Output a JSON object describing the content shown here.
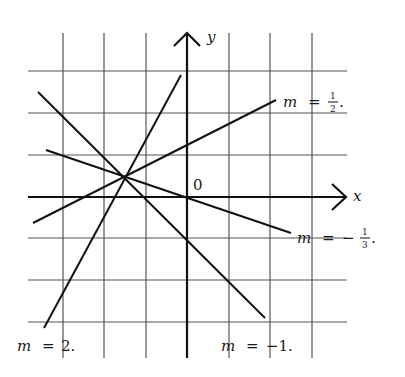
{
  "diagram": {
    "axes": {
      "x_label": "x",
      "y_label": "y",
      "origin_label": "0"
    },
    "grid": {
      "x_range": [
        -3.5,
        3.5
      ],
      "y_range": [
        -4,
        3
      ],
      "step": 1
    },
    "common_point": {
      "x": -1.5,
      "y": 0.5
    },
    "lines": [
      {
        "slope_label": "m = 2.",
        "m_text": "m",
        "eq_text": "=",
        "value_text": "2.",
        "slope": 2
      },
      {
        "slope_label": "m = -1.",
        "m_text": "m",
        "eq_text": "=",
        "value_text": "−1.",
        "slope": -1
      },
      {
        "slope_label": "m = 1/2.",
        "m_text": "m",
        "eq_text": "=",
        "num": "1",
        "den": "2",
        "sign": "",
        "slope": 0.5
      },
      {
        "slope_label": "m = -1/3.",
        "m_text": "m",
        "eq_text": "=",
        "num": "1",
        "den": "3",
        "sign": "−",
        "slope": -0.3333
      }
    ],
    "period": "."
  }
}
